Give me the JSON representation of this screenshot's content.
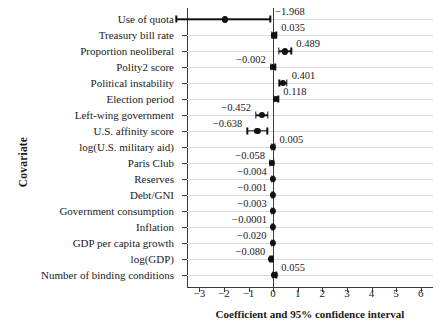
{
  "chart_data": {
    "type": "scatter",
    "title": "",
    "xlabel": "Coefficient and 95% confidence interval",
    "ylabel": "Covariate",
    "xlim": [
      -3.5,
      6.5
    ],
    "xticks": [
      -3,
      -2,
      -1,
      0,
      1,
      2,
      3,
      4,
      5,
      6
    ],
    "xticklabels": [
      "−3",
      "−2",
      "−1",
      "0",
      "1",
      "2",
      "3",
      "4",
      "5",
      "6"
    ],
    "grid": true,
    "legend": false,
    "reference_line": 0,
    "categories": [
      "Use of quota",
      "Treasury bill rate",
      "Proportion neoliberal",
      "Polity2 score",
      "Political instability",
      "Election period",
      "Left-wing government",
      "U.S. affinity score",
      "log(U.S. military aid)",
      "Paris Club",
      "Reserves",
      "Debt/GNI",
      "Government consumption",
      "Inflation",
      "GDP per capita growth",
      "log(GDP)",
      "Number of binding conditions"
    ],
    "values": [
      -1.968,
      0.035,
      0.489,
      -0.002,
      0.401,
      0.118,
      -0.452,
      -0.638,
      0.005,
      -0.058,
      -0.004,
      -0.001,
      -0.003,
      -0.0001,
      -0.02,
      -0.08,
      0.055
    ],
    "value_labels": [
      "−1.968",
      "0.035",
      "0.489",
      "−0.002",
      "0.401",
      "0.118",
      "−0.452",
      "−0.638",
      "0.005",
      "−0.058",
      "−0.004",
      "−0.001",
      "−0.003",
      "−0.0001",
      "−0.020",
      "−0.080",
      "0.055"
    ],
    "ci_low": [
      -3.93,
      -0.06,
      0.24,
      -0.1,
      0.25,
      0.03,
      -0.7,
      -1.05,
      -0.05,
      -0.13,
      -0.05,
      -0.04,
      -0.05,
      -0.04,
      -0.06,
      -0.12,
      -0.02
    ],
    "ci_high": [
      -0.12,
      0.13,
      0.74,
      0.09,
      0.55,
      0.21,
      -0.21,
      -0.23,
      0.06,
      0.02,
      0.04,
      0.04,
      0.04,
      0.04,
      0.02,
      -0.04,
      0.13
    ],
    "label_side": [
      "right",
      "right",
      "right",
      "left",
      "right",
      "right",
      "left",
      "left",
      "right",
      "left",
      "left",
      "left",
      "left",
      "left",
      "left",
      "left",
      "right"
    ]
  },
  "colors": {
    "marker": "#111111",
    "axis": "#3a3a3a",
    "grid": "#d9d9d9",
    "background": "#ffffff"
  }
}
